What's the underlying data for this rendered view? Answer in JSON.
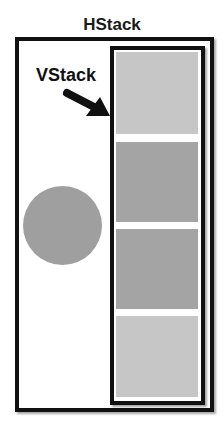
{
  "diagram": {
    "title": "HStack",
    "vstack_label": "VStack",
    "colors": {
      "light_gray": "#c6c6c6",
      "dark_gray": "#a4a4a4",
      "circle": "#9f9f9f",
      "border": "#111111"
    },
    "vstack_items": [
      {
        "name": "rect-1",
        "shade": "light"
      },
      {
        "name": "rect-2",
        "shade": "dark"
      },
      {
        "name": "rect-3",
        "shade": "dark"
      },
      {
        "name": "rect-4",
        "shade": "light"
      }
    ],
    "hstack_items": [
      "circle",
      "vstack"
    ]
  }
}
